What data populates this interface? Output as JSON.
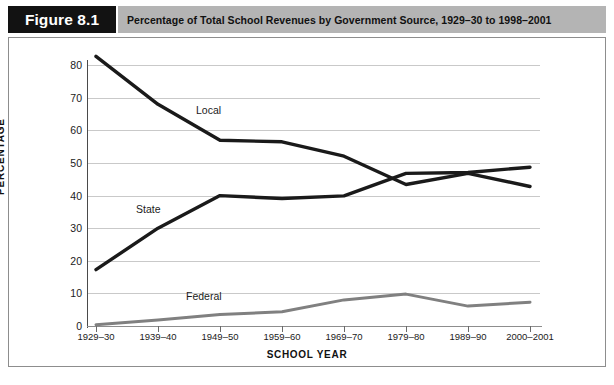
{
  "header": {
    "figure_badge": "Figure 8.1",
    "title": "Percentage of Total School Revenues by Government Source, 1929–30 to 1998–2001"
  },
  "axes": {
    "y_title": "PERCENTAGE",
    "x_title": "SCHOOL YEAR",
    "y_ticks": [
      "0",
      "10",
      "20",
      "30",
      "40",
      "50",
      "60",
      "70",
      "80"
    ],
    "x_ticks": [
      "1929–30",
      "1939–40",
      "1949–50",
      "1959–60",
      "1969–70",
      "1979–80",
      "1989–90",
      "2000–2001"
    ]
  },
  "series_labels": {
    "local": "Local",
    "state": "State",
    "federal": "Federal"
  },
  "colors": {
    "badge_bg": "#121212",
    "title_strip_bg": "#b4b4b4",
    "local_line": "#1a1a1a",
    "state_line": "#1a1a1a",
    "federal_line": "#808080",
    "gridline": "#c9c9c9",
    "panel_border": "#8d8d8d"
  },
  "chart_data": {
    "type": "line",
    "title": "Percentage of Total School Revenues by Government Source, 1929–30 to 1998–2001",
    "xlabel": "SCHOOL YEAR",
    "ylabel": "PERCENTAGE",
    "categories": [
      "1929–30",
      "1939–40",
      "1949–50",
      "1959–60",
      "1969–70",
      "1979–80",
      "1989–90",
      "2000–2001"
    ],
    "series": [
      {
        "name": "Local",
        "color": "#1a1a1a",
        "values": [
          82.7,
          68.0,
          57.0,
          56.5,
          52.1,
          43.4,
          46.8,
          42.8
        ]
      },
      {
        "name": "State",
        "color": "#1a1a1a",
        "values": [
          17.3,
          30.0,
          40.0,
          39.1,
          39.9,
          46.8,
          47.1,
          48.7
        ]
      },
      {
        "name": "Federal",
        "color": "#808080",
        "values": [
          0.4,
          1.8,
          3.5,
          4.4,
          8.0,
          9.8,
          6.1,
          7.3
        ]
      }
    ],
    "ylim": [
      0,
      85
    ],
    "y_ticks": [
      0,
      10,
      20,
      30,
      40,
      50,
      60,
      70,
      80
    ],
    "grid": true,
    "legend": "inline-labels"
  }
}
